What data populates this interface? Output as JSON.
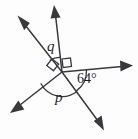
{
  "figure": {
    "type": "geometric-angle-diagram",
    "vertex": {
      "x": 62,
      "y": 72
    },
    "stroke_color": "#39393b",
    "text_color": "#1d1d1f",
    "background_color": "#fdfdfd",
    "rays": [
      {
        "name": "ray-up-left",
        "angle_deg": 125,
        "length": 62,
        "arrow": true
      },
      {
        "name": "ray-up",
        "angle_deg": 81,
        "length": 66,
        "arrow": true
      },
      {
        "name": "ray-right",
        "angle_deg": 1,
        "length": 72,
        "arrow": true
      },
      {
        "name": "ray-down-right",
        "angle_deg": -56,
        "length": 68,
        "arrow": true
      },
      {
        "name": "ray-down-left",
        "angle_deg": -153,
        "length": 64,
        "arrow": true
      }
    ],
    "angle_marks": [
      {
        "name": "angle-q",
        "label": "q",
        "between": [
          "ray-up-left",
          "ray-up"
        ],
        "marker": "arc",
        "label_x": 47,
        "label_y": 39
      },
      {
        "name": "angle-right-upper",
        "label": "",
        "between": [
          "ray-up",
          "ray-right"
        ],
        "marker": "right-angle-square",
        "value_deg": 90
      },
      {
        "name": "angle-right-left",
        "label": "",
        "between": [
          "ray-up-left",
          "ray-down-left"
        ],
        "marker": "right-angle-square",
        "value_deg": 90
      },
      {
        "name": "angle-64",
        "label": "64°",
        "between": [
          "ray-right",
          "ray-down-right"
        ],
        "marker": "arc",
        "value_deg": 64,
        "label_x": 77,
        "label_y": 72
      },
      {
        "name": "angle-p",
        "label": "p",
        "between": [
          "ray-down-right",
          "ray-down-left"
        ],
        "marker": "arc",
        "label_x": 55,
        "label_y": 90
      }
    ]
  },
  "labels": {
    "q": "q",
    "p": "p",
    "angle_64": "64°"
  }
}
